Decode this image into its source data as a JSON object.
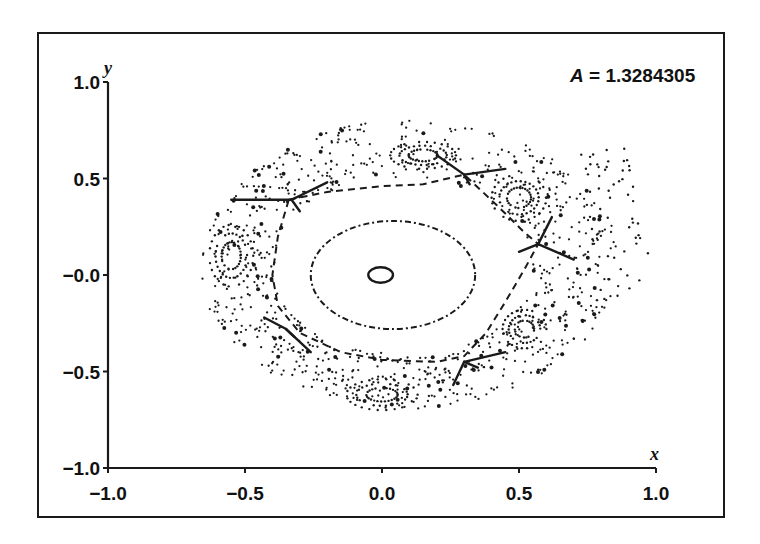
{
  "chart_data": {
    "type": "scatter",
    "title": "",
    "subtitle": "",
    "annotation": {
      "symbol": "A",
      "equals": " = ",
      "value": "1.3284305"
    },
    "xlabel": "x",
    "ylabel": "y",
    "xlim": [
      -1.0,
      1.0
    ],
    "ylim": [
      -1.0,
      1.0
    ],
    "xticks": [
      -1.0,
      -0.5,
      0.0,
      0.5,
      1.0
    ],
    "xtick_labels": [
      "−1.0",
      "−0.5",
      "0.0",
      "0.5",
      "1.0"
    ],
    "yticks": [
      -1.0,
      -0.5,
      0.0,
      0.5,
      1.0
    ],
    "ytick_labels": [
      "−1.0",
      "−0.5",
      "−0.0",
      "0.5",
      "1.0"
    ],
    "grid": false,
    "legend": null,
    "invariant_curves": [
      {
        "name": "inner-ring",
        "cx": -0.005,
        "cy": 0.0,
        "rx": 0.045,
        "ry": 0.04,
        "style": "solid"
      },
      {
        "name": "middle-oval",
        "cx": 0.04,
        "cy": 0.0,
        "rx": 0.3,
        "ry": 0.28,
        "style": "dashdot"
      },
      {
        "name": "separatrix-pentagon",
        "points": [
          [
            -0.34,
            0.39
          ],
          [
            -0.2,
            0.43
          ],
          [
            0.0,
            0.46
          ],
          [
            0.15,
            0.47
          ],
          [
            0.3,
            0.52
          ],
          [
            0.42,
            0.36
          ],
          [
            0.52,
            0.22
          ],
          [
            0.57,
            0.16
          ],
          [
            0.52,
            0.03
          ],
          [
            0.45,
            -0.14
          ],
          [
            0.38,
            -0.3
          ],
          [
            0.3,
            -0.42
          ],
          [
            0.2,
            -0.45
          ],
          [
            0.0,
            -0.44
          ],
          [
            -0.15,
            -0.4
          ],
          [
            -0.3,
            -0.3
          ],
          [
            -0.38,
            -0.16
          ],
          [
            -0.4,
            0.0
          ],
          [
            -0.38,
            0.2
          ],
          [
            -0.34,
            0.39
          ]
        ],
        "style": "dashed"
      }
    ],
    "hyperbolic_points": [
      {
        "x": -0.33,
        "y": 0.39,
        "arms": [
          [
            -0.55,
            0.39
          ],
          [
            -0.2,
            0.48
          ],
          [
            -0.3,
            0.33
          ]
        ]
      },
      {
        "x": 0.3,
        "y": 0.52,
        "arms": [
          [
            0.2,
            0.62
          ],
          [
            0.45,
            0.55
          ],
          [
            0.32,
            0.47
          ]
        ]
      },
      {
        "x": 0.57,
        "y": 0.16,
        "arms": [
          [
            0.62,
            0.3
          ],
          [
            0.7,
            0.08
          ],
          [
            0.5,
            0.12
          ]
        ]
      },
      {
        "x": 0.3,
        "y": -0.45,
        "arms": [
          [
            0.26,
            -0.57
          ],
          [
            0.45,
            -0.4
          ],
          [
            0.35,
            -0.48
          ]
        ]
      },
      {
        "x": -0.35,
        "y": -0.28,
        "arms": [
          [
            -0.43,
            -0.22
          ],
          [
            -0.26,
            -0.4
          ],
          [
            -0.32,
            -0.32
          ]
        ]
      }
    ],
    "island_chains": [
      {
        "cx": -0.55,
        "cy": 0.1,
        "rx": 0.08,
        "ry": 0.16
      },
      {
        "cx": 0.15,
        "cy": 0.62,
        "rx": 0.12,
        "ry": 0.07
      },
      {
        "cx": 0.5,
        "cy": 0.4,
        "rx": 0.1,
        "ry": 0.12
      },
      {
        "cx": 0.0,
        "cy": -0.62,
        "rx": 0.13,
        "ry": 0.08
      },
      {
        "cx": 0.52,
        "cy": -0.28,
        "rx": 0.08,
        "ry": 0.1
      }
    ],
    "chaotic_region": {
      "x_range": [
        -0.72,
        1.0
      ],
      "y_range": [
        -0.76,
        0.84
      ]
    }
  }
}
